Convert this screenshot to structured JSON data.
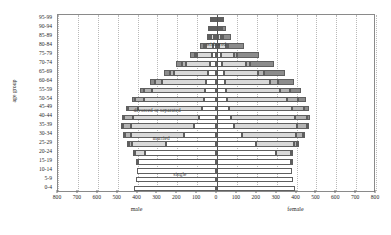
{
  "chart_data": {
    "type": "bar",
    "subtype": "population-pyramid-stacked",
    "title": "",
    "xlabel_left": "male",
    "xlabel_right": "female",
    "ylabel": "age group",
    "xlim": [
      0,
      800
    ],
    "xticks": [
      800,
      700,
      600,
      500,
      400,
      300,
      200,
      100,
      0,
      100,
      200,
      300,
      400,
      500,
      600,
      700,
      800
    ],
    "grid": true,
    "legend_position": "in-plot annotations",
    "annotations": [
      {
        "text": "widowed",
        "x_pct": 47.0,
        "y_pct": 15.0
      },
      {
        "text": "divorced or separated",
        "x_pct": 24.0,
        "y_pct": 52.5
      },
      {
        "text": "married",
        "x_pct": 30.0,
        "y_pct": 68.0
      },
      {
        "text": "single",
        "x_pct": 36.5,
        "y_pct": 88.5
      }
    ],
    "categories": [
      "95-99",
      "90-94",
      "85-89",
      "80-84",
      "75-79",
      "70-74",
      "65-69",
      "60-64",
      "55-59",
      "50-54",
      "45-49",
      "40-44",
      "35-39",
      "30-34",
      "25-29",
      "20-24",
      "15-19",
      "10-14",
      "5-9",
      "0-4"
    ],
    "stack_order": [
      "single",
      "married",
      "divorced",
      "widowed"
    ],
    "series": [
      {
        "name": "male",
        "side": "left",
        "stacks": {
          "single": [
            2,
            4,
            8,
            14,
            22,
            32,
            40,
            48,
            56,
            62,
            72,
            86,
            110,
            160,
            250,
            355,
            395,
            400,
            405,
            415
          ],
          "married": [
            2,
            5,
            14,
            36,
            72,
            120,
            170,
            225,
            268,
            300,
            320,
            330,
            320,
            270,
            175,
            55,
            4,
            0,
            0,
            0
          ],
          "divorced": [
            0,
            1,
            3,
            6,
            11,
            17,
            24,
            32,
            40,
            46,
            50,
            48,
            40,
            28,
            14,
            3,
            0,
            0,
            0,
            0
          ],
          "widowed": [
            2,
            4,
            10,
            20,
            28,
            32,
            30,
            26,
            20,
            16,
            12,
            8,
            5,
            3,
            1,
            0,
            0,
            0,
            0,
            0
          ]
        }
      },
      {
        "name": "female",
        "side": "right",
        "stacks": {
          "single": [
            3,
            6,
            11,
            17,
            24,
            32,
            38,
            44,
            50,
            56,
            64,
            74,
            92,
            130,
            200,
            300,
            375,
            382,
            386,
            395
          ],
          "married": [
            2,
            5,
            13,
            33,
            68,
            118,
            172,
            228,
            272,
            300,
            318,
            326,
            316,
            272,
            190,
            75,
            10,
            0,
            0,
            0
          ],
          "divorced": [
            1,
            2,
            4,
            8,
            14,
            22,
            31,
            40,
            49,
            56,
            60,
            58,
            48,
            34,
            17,
            4,
            0,
            0,
            0,
            0
          ],
          "widowed": [
            8,
            18,
            42,
            80,
            112,
            120,
            104,
            82,
            58,
            40,
            26,
            16,
            9,
            5,
            2,
            0,
            0,
            0,
            0,
            0
          ]
        }
      }
    ]
  }
}
